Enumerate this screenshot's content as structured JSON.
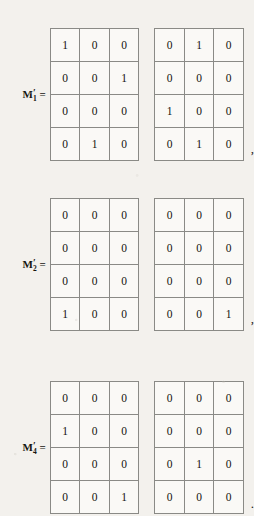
{
  "document": {
    "type": "scanned-math-page-fragment",
    "background_color": "#f3f1ed",
    "grid_line_color": "#8a8a86",
    "text_color": "#15130f",
    "cell_background": "#faf9f6"
  },
  "equations": [
    {
      "label": {
        "variable": "M",
        "prime": "′",
        "subscript": "1",
        "equals": "="
      },
      "matrices": [
        {
          "name": "left",
          "rows": [
            [
              "1",
              "0",
              "0"
            ],
            [
              "0",
              "0",
              "1"
            ],
            [
              "0",
              "0",
              "0"
            ],
            [
              "0",
              "1",
              "0"
            ]
          ]
        },
        {
          "name": "right",
          "rows": [
            [
              "0",
              "1",
              "0"
            ],
            [
              "0",
              "0",
              "0"
            ],
            [
              "1",
              "0",
              "0"
            ],
            [
              "0",
              "1",
              "0"
            ]
          ]
        }
      ],
      "punctuation": ","
    },
    {
      "label": {
        "variable": "M",
        "prime": "′",
        "subscript": "2",
        "equals": "="
      },
      "matrices": [
        {
          "name": "left",
          "rows": [
            [
              "0",
              "0",
              "0"
            ],
            [
              "0",
              "0",
              "0"
            ],
            [
              "0",
              "0",
              "0"
            ],
            [
              "1",
              "0",
              "0"
            ]
          ]
        },
        {
          "name": "right",
          "rows": [
            [
              "0",
              "0",
              "0"
            ],
            [
              "0",
              "0",
              "0"
            ],
            [
              "0",
              "0",
              "0"
            ],
            [
              "0",
              "0",
              "1"
            ]
          ]
        }
      ],
      "punctuation": ","
    },
    {
      "label": {
        "variable": "M",
        "prime": "′",
        "subscript": "4",
        "equals": "="
      },
      "matrices": [
        {
          "name": "left",
          "rows": [
            [
              "0",
              "0",
              "0"
            ],
            [
              "1",
              "0",
              "0"
            ],
            [
              "0",
              "0",
              "0"
            ],
            [
              "0",
              "0",
              "1"
            ]
          ]
        },
        {
          "name": "right",
          "rows": [
            [
              "0",
              "0",
              "0"
            ],
            [
              "0",
              "0",
              "0"
            ],
            [
              "0",
              "1",
              "0"
            ],
            [
              "0",
              "0",
              "0"
            ]
          ]
        }
      ],
      "punctuation": "."
    }
  ]
}
